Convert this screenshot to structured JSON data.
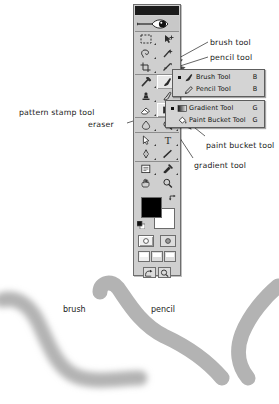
{
  "app": {
    "name": "Adobe Photoshop Toolbox",
    "title_bar_color": "#1b1b1b",
    "panel_color": "#cfcfcf",
    "menu_color": "#d4d4d4"
  },
  "toolbox": {
    "name": "toolbox-palette",
    "rows": [
      [
        {
          "tool": "marquee-tool",
          "has_flyout": true,
          "selected": false
        },
        {
          "tool": "move-tool",
          "has_flyout": false,
          "selected": false
        }
      ],
      [
        {
          "tool": "lasso-tool",
          "has_flyout": true,
          "selected": false
        },
        {
          "tool": "magic-wand-tool",
          "has_flyout": false,
          "selected": false
        }
      ],
      [
        {
          "tool": "crop-tool",
          "has_flyout": true,
          "selected": false
        },
        {
          "tool": "slice-tool",
          "has_flyout": true,
          "selected": false
        }
      ],
      [
        {
          "tool": "healing-brush-tool",
          "has_flyout": true,
          "selected": false
        },
        {
          "tool": "brush-tool",
          "has_flyout": true,
          "selected": true
        }
      ],
      [
        {
          "tool": "clone-stamp-tool",
          "has_flyout": true,
          "selected": false
        },
        {
          "tool": "history-brush-tool",
          "has_flyout": true,
          "selected": false
        }
      ],
      [
        {
          "tool": "eraser-tool",
          "has_flyout": true,
          "selected": false
        },
        {
          "tool": "gradient-tool",
          "has_flyout": true,
          "selected": true
        }
      ],
      [
        {
          "tool": "blur-tool",
          "has_flyout": true,
          "selected": false
        },
        {
          "tool": "dodge-tool",
          "has_flyout": true,
          "selected": false
        }
      ],
      [
        {
          "tool": "path-selection-tool",
          "has_flyout": true,
          "selected": false
        },
        {
          "tool": "type-tool",
          "has_flyout": true,
          "selected": false
        }
      ],
      [
        {
          "tool": "pen-tool",
          "has_flyout": true,
          "selected": false
        },
        {
          "tool": "line-shape-tool",
          "has_flyout": true,
          "selected": false
        }
      ],
      [
        {
          "tool": "notes-tool",
          "has_flyout": true,
          "selected": false
        },
        {
          "tool": "eyedropper-tool",
          "has_flyout": true,
          "selected": false
        }
      ],
      [
        {
          "tool": "hand-tool",
          "has_flyout": false,
          "selected": false
        },
        {
          "tool": "zoom-tool",
          "has_flyout": false,
          "selected": false
        }
      ]
    ],
    "colors": {
      "foreground": "#000000",
      "background": "#ffffff",
      "swap_icon": "swap-colors-icon",
      "default_icon": "default-colors-icon"
    },
    "mask_modes": [
      "standard-mask-mode",
      "quick-mask-mode"
    ],
    "screen_modes": [
      "standard-screen-mode",
      "full-screen-with-menubar-mode",
      "full-screen-mode"
    ],
    "jump_buttons": [
      "jump-to-imageready-icon",
      "jump-to-preview-icon"
    ]
  },
  "flyouts": {
    "brush": {
      "name": "brush-tool-flyout",
      "items": [
        {
          "label": "Brush Tool",
          "shortcut": "B",
          "icon": "brush-icon",
          "active": true
        },
        {
          "label": "Pencil Tool",
          "shortcut": "B",
          "icon": "pencil-icon",
          "active": false
        }
      ]
    },
    "gradient": {
      "name": "gradient-tool-flyout",
      "items": [
        {
          "label": "Gradient Tool",
          "shortcut": "G",
          "icon": "gradient-icon",
          "active": true
        },
        {
          "label": "Paint Bucket Tool",
          "shortcut": "G",
          "icon": "paint-bucket-icon",
          "active": false
        }
      ]
    }
  },
  "annotations": {
    "right": [
      {
        "key": "brush_tool",
        "text": "brush tool"
      },
      {
        "key": "pencil_tool",
        "text": "pencil tool"
      },
      {
        "key": "paint_bucket_tool",
        "text": "paint bucket tool"
      },
      {
        "key": "gradient_tool",
        "text": "gradient tool"
      }
    ],
    "left": [
      {
        "key": "pattern_stamp_tool",
        "text": "pattern stamp tool"
      },
      {
        "key": "eraser",
        "text": "eraser"
      }
    ]
  },
  "canvas": {
    "labels": [
      {
        "key": "brush_stroke",
        "text": "brush"
      },
      {
        "key": "pencil_stroke",
        "text": "pencil"
      }
    ],
    "stroke_color": "#b3b3b3"
  }
}
